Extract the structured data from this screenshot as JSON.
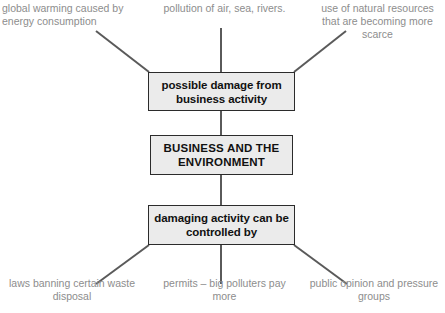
{
  "diagram": {
    "boxes": {
      "damage": "possible damage from business activity",
      "core": "BUSINESS AND THE ENVIRONMENT",
      "control": "damaging activity can be controlled by"
    },
    "causes": [
      "global warming caused by energy consumption",
      "pollution of air, sea, rivers.",
      "use of natural resources that are becoming more scarce"
    ],
    "controls": [
      "laws banning certain waste disposal",
      "permits – big polluters pay more",
      "public opinion and pressure groups"
    ],
    "colors": {
      "box_fill": "#ebebeb",
      "box_border": "#2b2b2b",
      "box_text": "#111111",
      "caption_text": "#8d8d8d",
      "connector": "#5a5a5a",
      "background": "#ffffff"
    }
  }
}
